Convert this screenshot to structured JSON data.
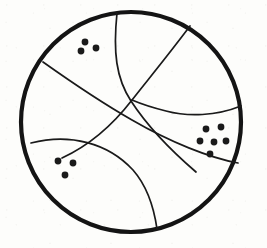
{
  "figure": {
    "kind": "line-drawing",
    "background_color": "#fdfdfb",
    "ink_color": "#1a1a1a",
    "canvas": {
      "width": 267,
      "height": 248
    }
  },
  "circle": {
    "label": "outer-circle",
    "center_x": 131,
    "center_y": 122,
    "radius": 110,
    "stroke_width": 4.2,
    "stroke_color": "#141414"
  },
  "dividing_lines": [
    {
      "label": "line-top-vertical",
      "description": "curve from top arc descending to center crossing region",
      "stroke_width": 1.7,
      "path": "M 117 13 C 113 52, 116 78, 131 101 C 146 124, 168 148, 196 172"
    },
    {
      "label": "line-upper-right-diagonal",
      "description": "curve from upper right arc sweeping down and right to arc",
      "stroke_width": 1.7,
      "path": "M 190 26 C 166 58, 146 82, 132 100 C 112 126, 88 146, 62 158"
    },
    {
      "label": "line-left-diagonal",
      "description": "long curve from left arc through centre to lower right arc",
      "stroke_width": 1.7,
      "path": "M 43 62 C 74 84, 104 104, 132 120 C 170 142, 210 158, 238 163"
    },
    {
      "label": "line-lower-left-arc",
      "description": "shallow curve from left arc bending to bottom arc",
      "stroke_width": 1.7,
      "path": "M 31 143 C 70 133, 108 143, 133 170 C 147 186, 154 208, 157 229"
    },
    {
      "label": "line-right-upper-arc",
      "description": "curve from right arc bending left toward center crossing",
      "stroke_width": 1.7,
      "path": "M 241 106 C 216 116, 188 117, 166 111 C 150 107, 139 103, 132 100"
    }
  ],
  "dot_clusters": [
    {
      "label": "cluster-top-left",
      "region": "upper-left region",
      "count": 3,
      "dot_radius": 3.4,
      "dots": [
        {
          "x": 85,
          "y": 42
        },
        {
          "x": 96,
          "y": 48
        },
        {
          "x": 81,
          "y": 51
        }
      ]
    },
    {
      "label": "cluster-right",
      "region": "right region",
      "count": 6,
      "dot_radius": 3.4,
      "dots": [
        {
          "x": 206,
          "y": 129
        },
        {
          "x": 221,
          "y": 127
        },
        {
          "x": 200,
          "y": 141
        },
        {
          "x": 214,
          "y": 142
        },
        {
          "x": 226,
          "y": 141
        },
        {
          "x": 210,
          "y": 154
        }
      ]
    },
    {
      "label": "cluster-bottom-left",
      "region": "lower-left region",
      "count": 3,
      "dot_radius": 3.4,
      "dots": [
        {
          "x": 58,
          "y": 161
        },
        {
          "x": 73,
          "y": 163
        },
        {
          "x": 65,
          "y": 175
        }
      ]
    }
  ],
  "totals": {
    "dot_count": 12,
    "cluster_count": 3,
    "line_count": 5
  }
}
